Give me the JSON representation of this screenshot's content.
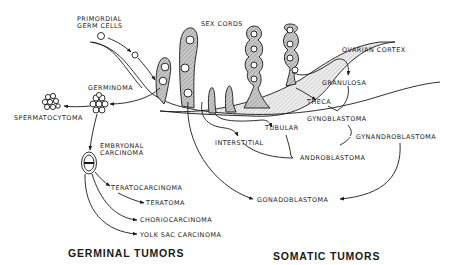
{
  "diagram": {
    "type": "histogenesis-of-gonadal-tumors",
    "labels": {
      "primordial_germ_cells": [
        "PRIMORDIAL",
        "GERM CELLS"
      ],
      "sex_cords": "SEX CORDS",
      "ovarian_cortex": "OVARIAN CORTEX",
      "germinoma": "GERMINOMA",
      "spermatocytoma": "SPERMATOCYTOMA",
      "embryonal_carcinoma": [
        "EMBRYONAL",
        "CARCINOMA"
      ],
      "teratocarcinoma": "TERATOCARCINOMA",
      "teratoma": "TERATOMA",
      "choriocarcinoma": "CHORIOCARCINOMA",
      "yolk_sac_carcinoma": "YOLK SAC CARCINOMA",
      "granulosa": "GRANULOSA",
      "theca": "THECA",
      "gynoblastoma": "GYNOBLASTOMA",
      "gynandroblastoma": "GYNANDROBLASTOMA",
      "tubular": "TUBULAR",
      "interstitial": "INTERSTITIAL",
      "androblastoma": "ANDROBLASTOMA",
      "gonadoblastoma": "GONADOBLASTOMA"
    },
    "section_titles": {
      "germinal": "GERMINAL TUMORS",
      "somatic": "SOMATIC TUMORS"
    },
    "edges": [
      {
        "from": "primordial germ cells",
        "to": "germinoma"
      },
      {
        "from": "germinoma",
        "to": "spermatocytoma"
      },
      {
        "from": "germinoma",
        "to": "embryonal carcinoma"
      },
      {
        "from": "embryonal carcinoma",
        "to": "teratocarcinoma"
      },
      {
        "from": "teratocarcinoma",
        "to": "teratoma"
      },
      {
        "from": "embryonal carcinoma",
        "to": "choriocarcinoma"
      },
      {
        "from": "embryonal carcinoma",
        "to": "yolk sac carcinoma"
      },
      {
        "from": "ovarian cortex",
        "to": "granulosa"
      },
      {
        "from": "ovarian cortex",
        "to": "theca"
      },
      {
        "from": "granulosa",
        "to": "gynoblastoma"
      },
      {
        "from": "theca",
        "to": "gynoblastoma"
      },
      {
        "from": "gynoblastoma",
        "to": "gynandroblastoma"
      },
      {
        "from": "androblastoma",
        "to": "gynandroblastoma"
      },
      {
        "from": "sex cords",
        "to": "tubular"
      },
      {
        "from": "sex cords",
        "to": "interstitial"
      },
      {
        "from": "tubular",
        "to": "androblastoma"
      },
      {
        "from": "interstitial",
        "to": "androblastoma"
      },
      {
        "from": "sex cords",
        "to": "gonadoblastoma"
      },
      {
        "from": "gynandroblastoma",
        "to": "gonadoblastoma"
      }
    ]
  }
}
